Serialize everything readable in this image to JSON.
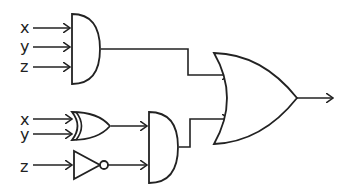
{
  "diagram": {
    "type": "logic-circuit",
    "inputs_top_and": [
      "x",
      "y",
      "z"
    ],
    "inputs_bottom_or": [
      "x",
      "y"
    ],
    "input_not": "z",
    "gates": [
      {
        "id": "and1",
        "type": "AND",
        "inputs": [
          "x",
          "y",
          "z"
        ]
      },
      {
        "id": "or1",
        "type": "OR",
        "inputs": [
          "x",
          "y"
        ]
      },
      {
        "id": "not1",
        "type": "NOT",
        "inputs": [
          "z"
        ]
      },
      {
        "id": "and2",
        "type": "AND",
        "inputs": [
          "or1",
          "not1"
        ]
      },
      {
        "id": "or2",
        "type": "OR",
        "inputs": [
          "and1",
          "and2"
        ]
      }
    ],
    "output": "or2"
  },
  "labels": {
    "a1x": "x",
    "a1y": "y",
    "a1z": "z",
    "o1x": "x",
    "o1y": "y",
    "n1z": "z"
  },
  "colors": {
    "stroke": "#222222",
    "background": "#ffffff"
  }
}
